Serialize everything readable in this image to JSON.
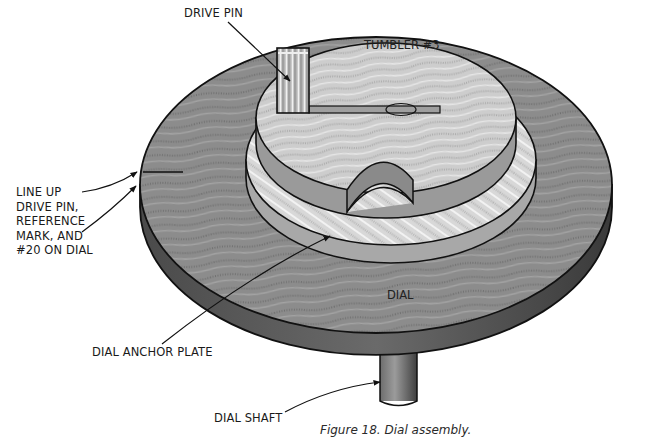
{
  "figure": {
    "caption": "Figure 18. Dial assembly.",
    "subject": "Dial assembly",
    "parts": {
      "drive_pin": "DRIVE PIN",
      "tumbler": "TUMBLER #3",
      "dial": "DIAL",
      "dial_anchor_plate": "DIAL ANCHOR PLATE",
      "dial_shaft": "DIAL SHAFT"
    },
    "callouts": {
      "line_up": "LINE UP\nDRIVE PIN,\nREFERENCE\nMARK, AND\n#20 ON DIAL"
    },
    "colors": {
      "dial_top": "#8a8a8a",
      "dial_edge": "#5e5e5e",
      "anchor_plate": "#d2d2d2",
      "tumbler_top": "#c4c4c4",
      "tumbler_side": "#9a9a9a",
      "outline": "#111111",
      "background": "#ffffff"
    }
  }
}
